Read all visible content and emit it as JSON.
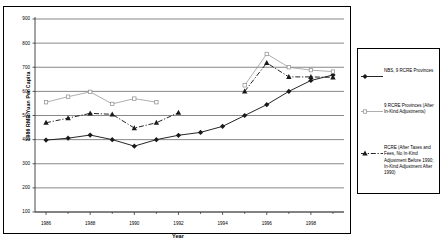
{
  "chart_data": {
    "type": "line",
    "title": "",
    "xlabel": "Year",
    "ylabel": "1986 RMB Yuan Per Capita",
    "xlim": [
      1985.5,
      1999.5
    ],
    "ylim": [
      100,
      900
    ],
    "yticks": [
      900,
      800,
      700,
      600,
      500,
      400,
      300,
      200,
      100
    ],
    "xticks": [
      1986,
      1988,
      1990,
      1992,
      1994,
      1996,
      1998
    ],
    "xtick_minor": [
      1987,
      1989,
      1991,
      1993,
      1995,
      1997,
      1999
    ],
    "grid": "horizontal",
    "legend_position": "right",
    "series": [
      {
        "name": "NBS, 9 RCRE Provinces",
        "marker": "diamond",
        "line": "solid",
        "color": "#1a1a1a",
        "x": [
          1986,
          1987,
          1988,
          1989,
          1990,
          1991,
          1992,
          1993,
          1994,
          1995,
          1996,
          1997,
          1998,
          1999
        ],
        "y": [
          398,
          406,
          419,
          400,
          373,
          400,
          418,
          430,
          455,
          500,
          545,
          600,
          645,
          668
        ]
      },
      {
        "name": "9 RCRE Provinces (After In-Kind Adjustments)",
        "marker": "square",
        "line": "solid",
        "color": "#8c8c8c",
        "x": [
          1986,
          1987,
          1988,
          1989,
          1990,
          1991,
          1992,
          1995,
          1996,
          1997,
          1998,
          1999
        ],
        "y": [
          555,
          578,
          598,
          548,
          570,
          555,
          null,
          625,
          755,
          700,
          688,
          682
        ]
      },
      {
        "name": "RCRE (After Taxes and Fees, No In-Kind Adjustment Before 1990; In-Kind Adjustment After 1990)",
        "marker": "triangle",
        "line": "dashdot",
        "color": "#1a1a1a",
        "x": [
          1986,
          1987,
          1988,
          1989,
          1990,
          1991,
          1992,
          1995,
          1996,
          1997,
          1998,
          1999
        ],
        "y": [
          470,
          489,
          509,
          505,
          448,
          470,
          512,
          600,
          718,
          660,
          660,
          658
        ]
      }
    ]
  },
  "axis": {
    "y_title": "1986 RMB Yuan Per Capita",
    "x_title": "Year",
    "y_labels": [
      "900",
      "800",
      "700",
      "600",
      "500",
      "400",
      "300",
      "200",
      "100"
    ],
    "x_labels": [
      "1986",
      "1988",
      "1990",
      "1992",
      "1994",
      "1996",
      "1998"
    ]
  },
  "legend": {
    "entries": [
      {
        "label": "NBS, 9 RCRE Provinces",
        "marker": "diamond",
        "style": "solid"
      },
      {
        "label": "9 RCRE Provinces (After In-Kind Adjustments)",
        "marker": "square",
        "style": "solid"
      },
      {
        "label": "RCRE (After Taxes and Fees, No In-Kind Adjustment Before 1990; In-Kind Adjustment After 1990)",
        "marker": "triangle",
        "style": "dashdot"
      }
    ]
  }
}
